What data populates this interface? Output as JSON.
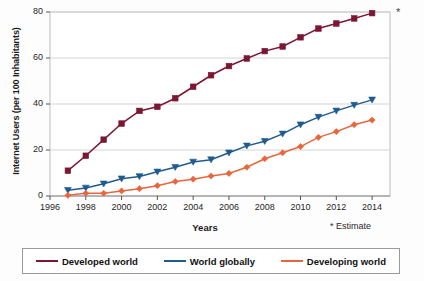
{
  "chart_data": {
    "type": "line",
    "title": "",
    "xlabel": "Years",
    "ylabel": "Internet Users (per 100 Inhabitants)",
    "xlim": [
      1996,
      2015
    ],
    "ylim": [
      0,
      80
    ],
    "xticks": [
      "1996",
      "1998",
      "2000",
      "2002",
      "2004",
      "2006",
      "2008",
      "2010",
      "2012",
      "2014"
    ],
    "xtick_values": [
      1996,
      1998,
      2000,
      2002,
      2004,
      2006,
      2008,
      2010,
      2012,
      2014
    ],
    "yticks": [
      "0",
      "20",
      "40",
      "60",
      "80"
    ],
    "ytick_values": [
      0,
      20,
      40,
      60,
      80
    ],
    "grid": "horizontal",
    "legend_position": "below",
    "annotations": [
      "* Estimate"
    ],
    "x": [
      1997,
      1998,
      1999,
      2000,
      2001,
      2002,
      2003,
      2004,
      2005,
      2006,
      2007,
      2008,
      2009,
      2010,
      2011,
      2012,
      2013,
      2014
    ],
    "series": [
      {
        "name": "Developed world",
        "color": "#7B1733",
        "marker": "square",
        "values": [
          11,
          17.5,
          24.5,
          31.5,
          37,
          38.8,
          42.5,
          47.5,
          52.5,
          56.5,
          59.8,
          63,
          65,
          69,
          72.8,
          75,
          77.2,
          79.5
        ]
      },
      {
        "name": "World globally",
        "color": "#1F5B8F",
        "marker": "triangle-down",
        "values": [
          2.5,
          3.5,
          5.3,
          7.5,
          8.5,
          10.5,
          12.5,
          14.8,
          15.8,
          18.8,
          21.8,
          23.8,
          27,
          31,
          34.3,
          37,
          39.5,
          41.8
        ]
      },
      {
        "name": "Developing world",
        "color": "#E8663C",
        "marker": "diamond",
        "values": [
          0.3,
          1.2,
          1.2,
          2.2,
          3.2,
          4.5,
          6.3,
          7.3,
          8.7,
          9.8,
          12.5,
          16.2,
          18.8,
          21.5,
          25.5,
          28,
          31,
          33
        ]
      }
    ]
  },
  "axis": {
    "ylabel": "Internet Users (per 100 Inhabitants)",
    "xlabel": "Years",
    "estimate_note": "* Estimate",
    "estimate_marker": "*"
  },
  "legend": {
    "items": [
      {
        "label": "Developed world",
        "color": "#7B1733"
      },
      {
        "label": "World globally",
        "color": "#1F5B8F"
      },
      {
        "label": "Developing world",
        "color": "#E8663C"
      }
    ]
  }
}
